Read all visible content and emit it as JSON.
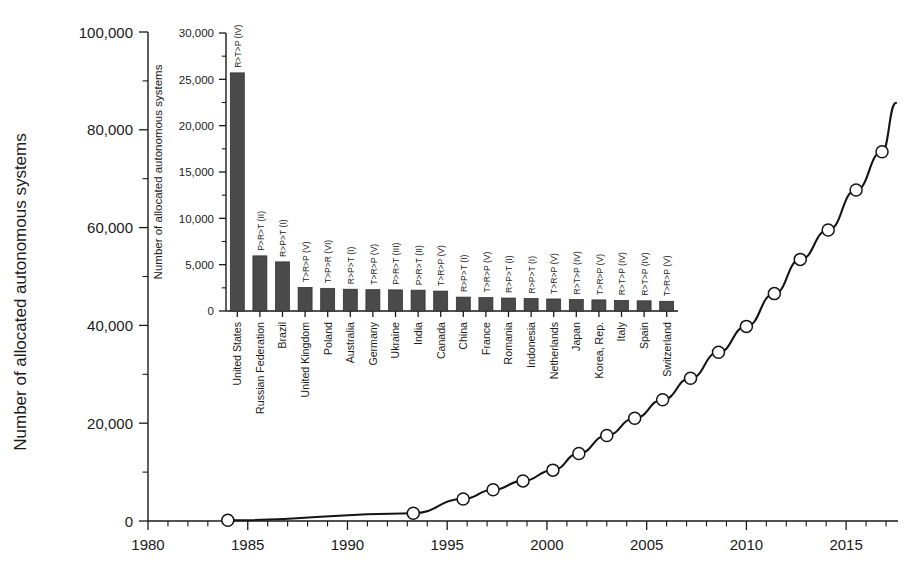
{
  "figure": {
    "main_axis_title_y": "Number of allocated autonomous systems",
    "inset_axis_title_y": "Number of allocated autonomous systems"
  },
  "chart_data": [
    {
      "id": "main",
      "type": "line",
      "title": "",
      "xlabel": "",
      "ylabel": "Number of allocated autonomous systems",
      "xlim": [
        1980,
        2017.6
      ],
      "ylim": [
        0,
        100000
      ],
      "xticks": [
        1980,
        1985,
        1990,
        1995,
        2000,
        2005,
        2010,
        2015
      ],
      "xtick_labels": [
        "1980",
        "1985",
        "1990",
        "1995",
        "2000",
        "2005",
        "2010",
        "2015"
      ],
      "x_minor_interval": 1,
      "yticks": [
        0,
        20000,
        40000,
        60000,
        80000,
        100000
      ],
      "ytick_labels": [
        "0",
        "20,000",
        "40,000",
        "60,000",
        "80,000",
        "100,000"
      ],
      "y_minor_interval": 10000,
      "grid": false,
      "legend": "none",
      "markers": "open-circle",
      "x": [
        1984,
        1993.3,
        1995.8,
        1997.3,
        1998.8,
        2000.3,
        2001.6,
        2003.0,
        2004.4,
        2005.8,
        2007.2,
        2008.6,
        2010.0,
        2011.4,
        2012.7,
        2014.1,
        2015.5,
        2016.8
      ],
      "y": [
        150,
        1600,
        4500,
        6400,
        8200,
        10400,
        13800,
        17500,
        21000,
        24800,
        29200,
        34500,
        39800,
        46500,
        53500,
        59500,
        67700,
        75500
      ],
      "line_end_x": 2017.5,
      "line_end_y": 85500
    },
    {
      "id": "inset",
      "type": "bar",
      "title": "",
      "xlabel": "",
      "ylabel": "Number of allocated autonomous systems",
      "ylim": [
        0,
        30000
      ],
      "yticks": [
        0,
        5000,
        10000,
        15000,
        20000,
        25000,
        30000
      ],
      "ytick_labels": [
        "0",
        "5,000",
        "10,000",
        "15,000",
        "20,000",
        "25,000",
        "30,000"
      ],
      "y_minor_interval": 2500,
      "grid": false,
      "legend": "none",
      "categories": [
        "United States",
        "Russian Federation",
        "Brazil",
        "United Kingdom",
        "Poland",
        "Australia",
        "Germany",
        "Ukraine",
        "India",
        "Canada",
        "China",
        "France",
        "Romania",
        "Indonesia",
        "Netherlands",
        "Japan",
        "Korea, Rep.",
        "Italy",
        "Spain",
        "Switzerland"
      ],
      "values": [
        25700,
        5950,
        5300,
        2550,
        2450,
        2350,
        2300,
        2280,
        2250,
        2150,
        1500,
        1450,
        1400,
        1350,
        1300,
        1250,
        1200,
        1150,
        1100,
        1050
      ],
      "bar_codes": [
        "R>T>P (IV)",
        "P>R>T (II)",
        "R>P>T (I)",
        "T>R>P (V)",
        "T>P>R (VI)",
        "R>P>T (I)",
        "T>R>P (V)",
        "P>R>T (III)",
        "P>R>T (II)",
        "T>R>P (V)",
        "R>P>T (I)",
        "T>R>P (V)",
        "R>P>T (I)",
        "R>P>T (I)",
        "T>R>P (V)",
        "R>T>P (IV)",
        "T>R>P (V)",
        "R>T>P (IV)",
        "R>T>P (IV)",
        "T>R>P (V)"
      ]
    }
  ]
}
